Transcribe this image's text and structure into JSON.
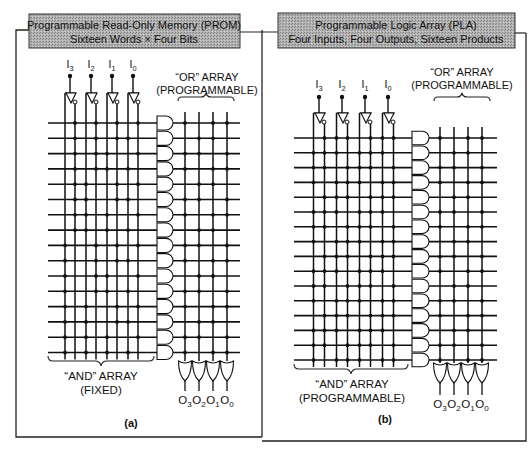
{
  "panels": [
    {
      "id": "a",
      "title_line1": "Programmable Read-Only Memory (PROM)",
      "title_line2": "Sixteen Words × Four Bits",
      "inputs": [
        "I3",
        "I2",
        "I1",
        "I0"
      ],
      "or_array_label_line1": "“OR” ARRAY",
      "or_array_label_line2": "(PROGRAMMABLE)",
      "and_array_label_line1": "“AND” ARRAY",
      "and_array_label_line2": "(FIXED)",
      "outputs": [
        "O3",
        "O2",
        "O1",
        "O0"
      ],
      "caption": "(a)",
      "product_lines": 16
    },
    {
      "id": "b",
      "title_line1": "Programmable Logic Array (PLA)",
      "title_line2": "Four Inputs, Four Outputs, Sixteen Products",
      "inputs": [
        "I3",
        "I2",
        "I1",
        "I0"
      ],
      "or_array_label_line1": "“OR” ARRAY",
      "or_array_label_line2": "(PROGRAMMABLE)",
      "and_array_label_line1": "“AND” ARRAY",
      "and_array_label_line2": "(PROGRAMMABLE)",
      "outputs": [
        "O3",
        "O2",
        "O1",
        "O0"
      ],
      "caption": "(b)",
      "product_lines": 16
    }
  ],
  "colors": {
    "ink": "#111111",
    "title_box_fill": "#a9a9a9",
    "background": "#ffffff"
  }
}
